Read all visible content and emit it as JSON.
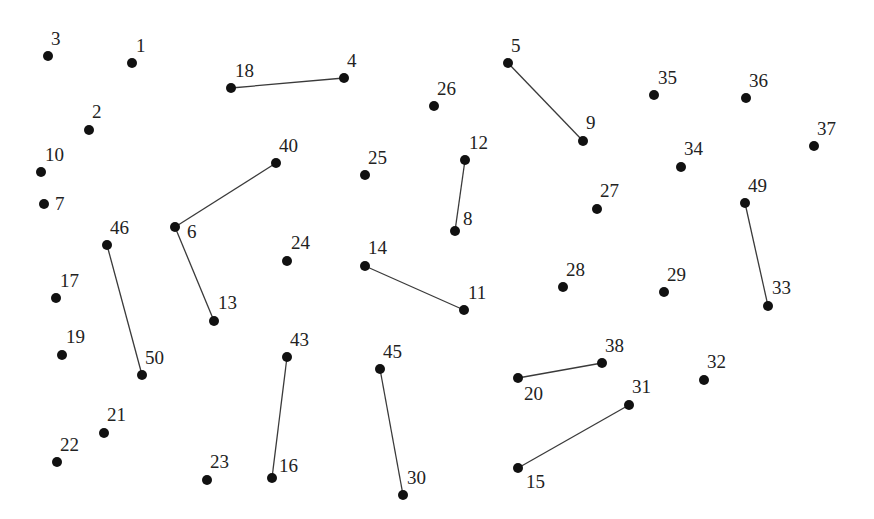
{
  "diagram": {
    "type": "connect-the-dots",
    "background": "#ffffff",
    "point_color": "#111111",
    "line_color": "#3a3a3a",
    "points": [
      {
        "id": "1",
        "x": 132,
        "y": 63,
        "lx": 136,
        "ly": 52,
        "label": "1"
      },
      {
        "id": "2",
        "x": 89,
        "y": 130,
        "lx": 92,
        "ly": 118,
        "label": "2"
      },
      {
        "id": "3",
        "x": 48,
        "y": 56,
        "lx": 51,
        "ly": 45,
        "label": "3"
      },
      {
        "id": "4",
        "x": 344,
        "y": 78,
        "lx": 347,
        "ly": 67,
        "label": "4"
      },
      {
        "id": "5",
        "x": 508,
        "y": 63,
        "lx": 511,
        "ly": 52,
        "label": "5"
      },
      {
        "id": "6",
        "x": 175,
        "y": 227,
        "lx": 187,
        "ly": 238,
        "label": "6"
      },
      {
        "id": "7",
        "x": 44,
        "y": 204,
        "lx": 55,
        "ly": 210,
        "label": "7"
      },
      {
        "id": "8",
        "x": 455,
        "y": 231,
        "lx": 463,
        "ly": 225,
        "label": "8"
      },
      {
        "id": "9",
        "x": 583,
        "y": 141,
        "lx": 586,
        "ly": 129,
        "label": "9"
      },
      {
        "id": "10",
        "x": 41,
        "y": 172,
        "lx": 45,
        "ly": 161,
        "label": "10"
      },
      {
        "id": "11",
        "x": 464,
        "y": 310,
        "lx": 468,
        "ly": 299,
        "label": "11"
      },
      {
        "id": "12",
        "x": 465,
        "y": 160,
        "lx": 469,
        "ly": 149,
        "label": "12"
      },
      {
        "id": "13",
        "x": 214,
        "y": 321,
        "lx": 218,
        "ly": 309,
        "label": "13"
      },
      {
        "id": "14",
        "x": 365,
        "y": 266,
        "lx": 368,
        "ly": 254,
        "label": "14"
      },
      {
        "id": "15",
        "x": 518,
        "y": 468,
        "lx": 526,
        "ly": 488,
        "label": "15"
      },
      {
        "id": "16",
        "x": 272,
        "y": 478,
        "lx": 279,
        "ly": 472,
        "label": "16"
      },
      {
        "id": "17",
        "x": 56,
        "y": 298,
        "lx": 60,
        "ly": 287,
        "label": "17"
      },
      {
        "id": "18",
        "x": 231,
        "y": 88,
        "lx": 235,
        "ly": 77,
        "label": "18"
      },
      {
        "id": "19",
        "x": 62,
        "y": 355,
        "lx": 66,
        "ly": 343,
        "label": "19"
      },
      {
        "id": "20",
        "x": 518,
        "y": 378,
        "lx": 524,
        "ly": 400,
        "label": "20"
      },
      {
        "id": "21",
        "x": 104,
        "y": 433,
        "lx": 107,
        "ly": 421,
        "label": "21"
      },
      {
        "id": "22",
        "x": 57,
        "y": 462,
        "lx": 60,
        "ly": 451,
        "label": "22"
      },
      {
        "id": "23",
        "x": 207,
        "y": 480,
        "lx": 210,
        "ly": 468,
        "label": "23"
      },
      {
        "id": "24",
        "x": 287,
        "y": 261,
        "lx": 291,
        "ly": 249,
        "label": "24"
      },
      {
        "id": "25",
        "x": 365,
        "y": 175,
        "lx": 368,
        "ly": 164,
        "label": "25"
      },
      {
        "id": "26",
        "x": 434,
        "y": 106,
        "lx": 437,
        "ly": 95,
        "label": "26"
      },
      {
        "id": "27",
        "x": 597,
        "y": 209,
        "lx": 600,
        "ly": 197,
        "label": "27"
      },
      {
        "id": "28",
        "x": 563,
        "y": 287,
        "lx": 566,
        "ly": 276,
        "label": "28"
      },
      {
        "id": "29",
        "x": 664,
        "y": 292,
        "lx": 667,
        "ly": 281,
        "label": "29"
      },
      {
        "id": "30",
        "x": 403,
        "y": 495,
        "lx": 407,
        "ly": 484,
        "label": "30"
      },
      {
        "id": "31",
        "x": 629,
        "y": 405,
        "lx": 632,
        "ly": 393,
        "label": "31"
      },
      {
        "id": "32",
        "x": 704,
        "y": 380,
        "lx": 707,
        "ly": 368,
        "label": "32"
      },
      {
        "id": "33",
        "x": 768,
        "y": 306,
        "lx": 772,
        "ly": 294,
        "label": "33"
      },
      {
        "id": "34",
        "x": 681,
        "y": 167,
        "lx": 684,
        "ly": 155,
        "label": "34"
      },
      {
        "id": "35",
        "x": 654,
        "y": 95,
        "lx": 658,
        "ly": 84,
        "label": "35"
      },
      {
        "id": "36",
        "x": 746,
        "y": 98,
        "lx": 749,
        "ly": 87,
        "label": "36"
      },
      {
        "id": "37",
        "x": 814,
        "y": 146,
        "lx": 817,
        "ly": 135,
        "label": "37"
      },
      {
        "id": "38",
        "x": 602,
        "y": 363,
        "lx": 605,
        "ly": 352,
        "label": "38"
      },
      {
        "id": "40",
        "x": 276,
        "y": 163,
        "lx": 279,
        "ly": 152,
        "label": "40"
      },
      {
        "id": "43",
        "x": 287,
        "y": 357,
        "lx": 290,
        "ly": 346,
        "label": "43"
      },
      {
        "id": "45",
        "x": 380,
        "y": 369,
        "lx": 383,
        "ly": 358,
        "label": "45"
      },
      {
        "id": "46",
        "x": 107,
        "y": 245,
        "lx": 110,
        "ly": 234,
        "label": "46"
      },
      {
        "id": "49",
        "x": 745,
        "y": 203,
        "lx": 748,
        "ly": 192,
        "label": "49"
      },
      {
        "id": "50",
        "x": 142,
        "y": 375,
        "lx": 145,
        "ly": 364,
        "label": "50"
      }
    ],
    "edges": [
      [
        "18",
        "4"
      ],
      [
        "5",
        "9"
      ],
      [
        "40",
        "6"
      ],
      [
        "6",
        "13"
      ],
      [
        "12",
        "8"
      ],
      [
        "46",
        "50"
      ],
      [
        "14",
        "11"
      ],
      [
        "49",
        "33"
      ],
      [
        "43",
        "16"
      ],
      [
        "45",
        "30"
      ],
      [
        "20",
        "38"
      ],
      [
        "15",
        "31"
      ]
    ]
  }
}
